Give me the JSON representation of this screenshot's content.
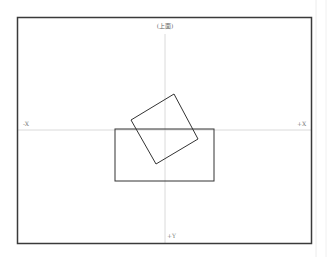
{
  "diagram": {
    "view_title": "(上面)",
    "axis_labels": {
      "left": "-X",
      "right": "+X",
      "bottom": "+Y"
    },
    "colors": {
      "frame": "#3a3a3a",
      "axis": "#d0d0d0",
      "shape_stroke": "#333333",
      "background": "#ffffff",
      "side_guides": "#ececec"
    },
    "frame": {
      "x": 17,
      "y": 17,
      "width": 295,
      "height": 227
    },
    "axes": {
      "horizontal_y": 130,
      "vertical_x": 165
    },
    "shapes": [
      {
        "type": "rectangle",
        "name": "base-rectangle",
        "x": 115,
        "y": 129,
        "width": 99,
        "height": 52
      },
      {
        "type": "rotated-square",
        "name": "tilted-square",
        "points": [
          [
            174,
            94
          ],
          [
            198,
            139
          ],
          [
            156,
            164
          ],
          [
            131,
            120
          ]
        ]
      }
    ]
  }
}
